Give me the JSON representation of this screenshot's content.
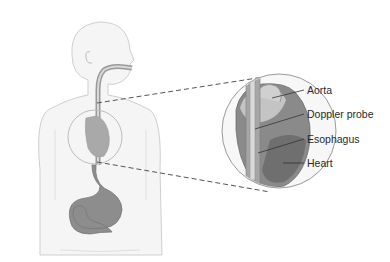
{
  "figure": {
    "colors": {
      "body_outline": "#c8c8c8",
      "body_fill": "#f4f4f4",
      "organ_fill": "#8a8a8a",
      "heart_fill": "#7a7a7a",
      "probe": "#b0b0b0",
      "dash": "#555555",
      "label_text": "#2a2a2a"
    },
    "labels": [
      {
        "text": "Aorta",
        "x": 307,
        "y": 84
      },
      {
        "text": "Doppler probe",
        "x": 307,
        "y": 108
      },
      {
        "text": "Esophagus",
        "x": 307,
        "y": 133
      },
      {
        "text": "Heart",
        "x": 307,
        "y": 157
      }
    ]
  }
}
